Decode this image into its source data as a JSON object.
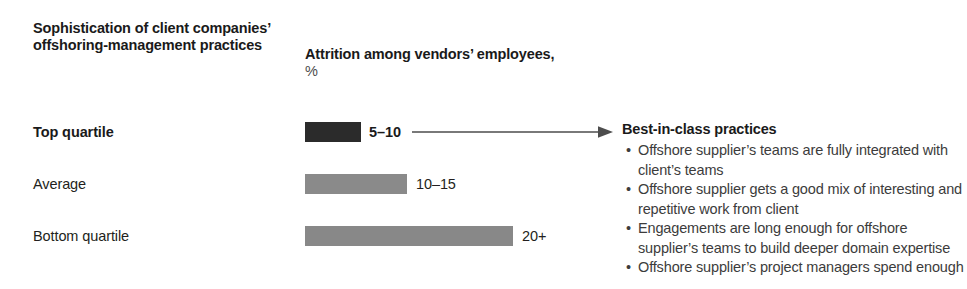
{
  "headers": {
    "left": "Sophistication of client companies’ offshoring-management practices",
    "middle_main": "Attrition among vendors’ employees,",
    "middle_unit": "%"
  },
  "chart_data": {
    "type": "bar",
    "orientation": "horizontal",
    "title": "Sophistication of client companies’ offshoring-management practices",
    "xlabel": "Attrition among vendors’ employees, %",
    "ylabel": "",
    "categories": [
      "Top quartile",
      "Average",
      "Bottom quartile"
    ],
    "value_labels": [
      "5–10",
      "10–15",
      "20+"
    ],
    "values": [
      7.5,
      12.5,
      22
    ],
    "value_ranges": [
      [
        5,
        10
      ],
      [
        10,
        15
      ],
      [
        20,
        null
      ]
    ],
    "bar_colors": [
      "#2b2b2b",
      "#8a8a8a",
      "#888888"
    ],
    "bar_pixel_widths": [
      56,
      102,
      208
    ],
    "grid": false,
    "legend": false,
    "xlim": [
      0,
      25
    ]
  },
  "rows": [
    {
      "label": "Top quartile",
      "value_label": "5–10",
      "emphasis": true,
      "bar_width_px": 56,
      "bar_color": "#2b2b2b",
      "value_left_px": 369
    },
    {
      "label": "Average",
      "value_label": "10–15",
      "emphasis": false,
      "bar_width_px": 102,
      "bar_color": "#8a8a8a",
      "value_left_px": 416
    },
    {
      "label": "Bottom quartile",
      "value_label": "20+",
      "emphasis": false,
      "bar_width_px": 208,
      "bar_color": "#888888",
      "value_left_px": 522
    }
  ],
  "connector": {
    "icon": "arrow-right-icon",
    "color": "#4d4d4d"
  },
  "callout": {
    "title": "Best-in-class practices",
    "bullet_glyph": "•",
    "bullets": [
      "Offshore supplier’s teams are fully integrated with client’s teams",
      "Offshore supplier gets a good mix of interesting and repetitive work from client",
      "Engagements are long enough for offshore supplier’s teams to build deeper domain expertise",
      "Offshore supplier’s project managers spend enough"
    ]
  }
}
